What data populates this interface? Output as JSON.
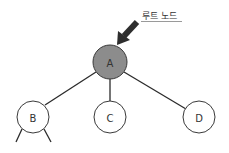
{
  "diagram": {
    "type": "tree",
    "annotation": {
      "label": "루트 노드",
      "target": "A",
      "color": "#2e2e2e"
    },
    "nodes": [
      {
        "id": "A",
        "label": "A",
        "fill": "#8c8c8c",
        "role": "root"
      },
      {
        "id": "B",
        "label": "B",
        "fill": "#ffffff"
      },
      {
        "id": "C",
        "label": "C",
        "fill": "#ffffff"
      },
      {
        "id": "D",
        "label": "D",
        "fill": "#ffffff"
      }
    ],
    "edges": [
      {
        "from": "A",
        "to": "B"
      },
      {
        "from": "A",
        "to": "C"
      },
      {
        "from": "A",
        "to": "D"
      },
      {
        "from": "B",
        "to": "(continues)"
      },
      {
        "from": "B",
        "to": "(continues)"
      }
    ]
  }
}
